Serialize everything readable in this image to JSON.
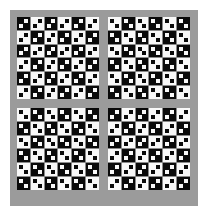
{
  "image": {
    "description": "Checkerboard optical illusion: four 6x6 checkerboards with corner dots inside a gray frame",
    "colors": {
      "frame": "#9b9b9b",
      "black": "#0a0a0a",
      "white": "#f8f8f8",
      "grid_line": "#8a8a8a"
    },
    "grid": {
      "rows": 6,
      "cols": 6
    },
    "quadrants": [
      {
        "name": "top-left",
        "left": 17,
        "top": 17,
        "first_cell": "b",
        "dots": [
          "tr",
          "bl"
        ]
      },
      {
        "name": "top-right",
        "left": 108,
        "top": 17,
        "first_cell": "w",
        "dots": [
          "tl",
          "br"
        ]
      },
      {
        "name": "bottom-left",
        "left": 17,
        "top": 108,
        "first_cell": "w",
        "dots": [
          "tl",
          "br"
        ]
      },
      {
        "name": "bottom-right",
        "left": 108,
        "top": 108,
        "first_cell": "b",
        "dots": [
          "tr",
          "bl"
        ]
      }
    ]
  }
}
